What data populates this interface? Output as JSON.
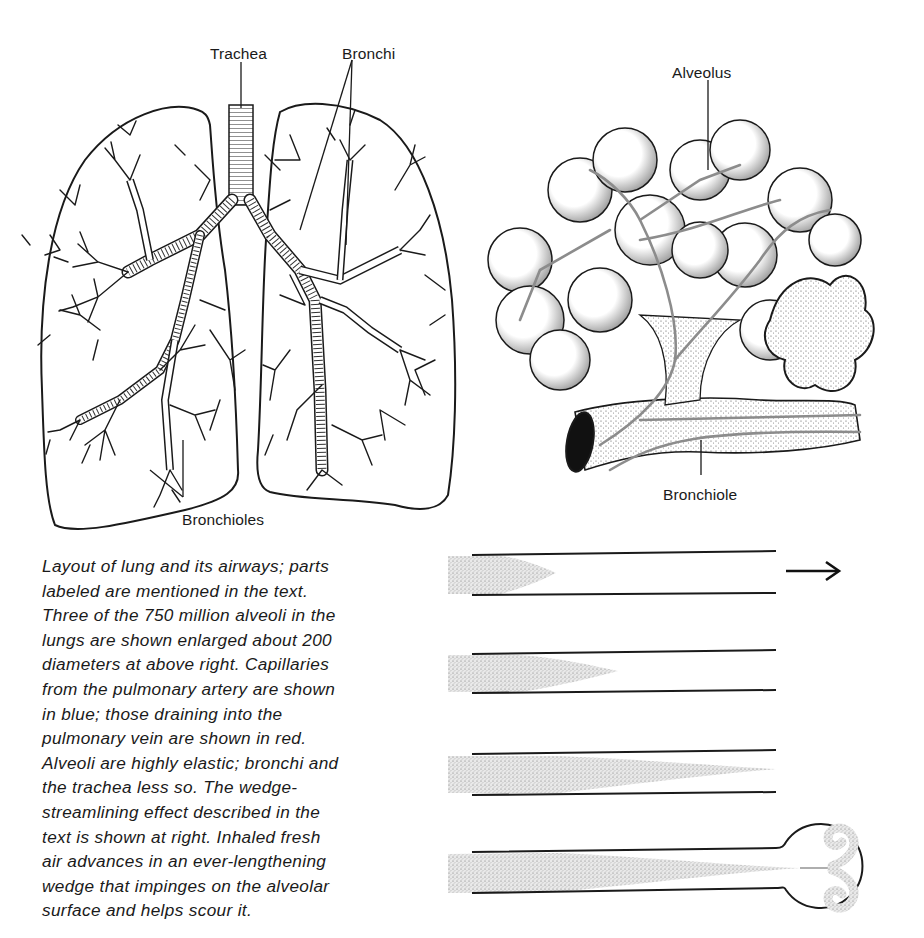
{
  "figure": {
    "lung_diagram": {
      "labels": {
        "trachea": "Trachea",
        "bronchi": "Bronchi",
        "bronchioles": "Bronchioles"
      }
    },
    "alveoli_diagram": {
      "labels": {
        "alveolus": "Alveolus",
        "bronchiole": "Bronchiole"
      }
    },
    "caption": {
      "lines": [
        "Layout of lung and its airways; parts",
        "labeled are mentioned in the text.",
        "Three of the 750 million alveoli in the",
        "lungs are shown enlarged about 200",
        "diameters at above right. Capillaries",
        "from the pulmonary artery are shown",
        "in blue; those draining into the",
        "pulmonary vein are shown in red.",
        "Alveoli are highly elastic; bronchi and",
        "the trachea less so. The wedge-",
        "streamlining effect described in the",
        "text is shown at right. Inhaled fresh",
        "air advances in an ever-lengthening",
        "wedge that impinges on the alveolar",
        "surface and helps scour it."
      ]
    },
    "wedge_diagram": {
      "stages": [
        {
          "name": "stage-1",
          "wedge_tip_fraction": 0.28
        },
        {
          "name": "stage-2",
          "wedge_tip_fraction": 0.45
        },
        {
          "name": "stage-3",
          "wedge_tip_fraction": 1.0
        },
        {
          "name": "stage-4",
          "wedge_tip_fraction": 1.0,
          "ends_in_alveolus": true
        }
      ],
      "flow_arrow": "→"
    },
    "colors": {
      "ink": "#1a1a1a",
      "stipple": "#8a8a8a",
      "capillary": "#9a9a9a",
      "background": "#ffffff"
    }
  }
}
